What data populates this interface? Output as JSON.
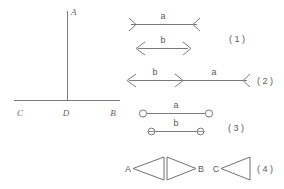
{
  "figure": {
    "background_color": "#ffffff",
    "line_color": "#7a7a7a",
    "label_color": "#666666",
    "width": 284,
    "height": 189
  },
  "left_diagram": {
    "name": "perpendicular-line-figure",
    "description": "Vertical ray meeting a horizontal line at point D",
    "labels": {
      "top": "A",
      "left": "C",
      "middle": "D",
      "right": "B"
    }
  },
  "diagrams": [
    {
      "number": "( 1 )",
      "rows": [
        {
          "label": "a",
          "left_end": "flare-right",
          "right_end": "flare-left"
        },
        {
          "label": "b",
          "left_end": "arrow-left",
          "right_end": "arrow-right"
        }
      ]
    },
    {
      "number": "( 2 )",
      "rows": [
        {
          "label": "b",
          "left_end": "arrow-left",
          "right_end": "arrow-right"
        },
        {
          "label": "a",
          "left_end": "none",
          "right_end": "flare-left"
        }
      ]
    },
    {
      "number": "( 3 )",
      "rows": [
        {
          "label": "a",
          "left_end": "open-circle",
          "right_end": "open-circle"
        },
        {
          "label": "b",
          "left_end": "barred-circle",
          "right_end": "barred-circle"
        }
      ]
    },
    {
      "number": "( 4 )",
      "endpoints": {
        "first": "A",
        "second": "B",
        "third": "C"
      },
      "shapes": [
        {
          "name": "triangle-left",
          "direction": "left"
        },
        {
          "name": "triangle-right",
          "direction": "right"
        },
        {
          "name": "triangle-left",
          "direction": "left"
        }
      ]
    }
  ]
}
